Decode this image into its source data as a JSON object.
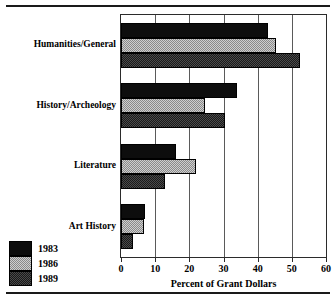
{
  "chart_data": {
    "type": "bar",
    "orientation": "horizontal",
    "title": "",
    "xlabel": "Percent of Grant Dollars",
    "ylabel": "",
    "xlim": [
      0,
      60
    ],
    "ylim": null,
    "xticks": [
      0,
      10,
      20,
      30,
      40,
      50,
      60
    ],
    "xtick_labels": [
      "0",
      "10",
      "20",
      "30",
      "40",
      "50",
      "60"
    ],
    "grid": "vertical",
    "legend_position": "bottom-left-outside",
    "categories": [
      "Humanities/General",
      "History/Archeology",
      "Literature",
      "Art History"
    ],
    "series": [
      {
        "name": "1983",
        "color": "#0d0d0d",
        "values": [
          43.0,
          34.0,
          16.0,
          7.0
        ]
      },
      {
        "name": "1986",
        "color": "#cfcfcf",
        "values": [
          45.5,
          24.5,
          22.0,
          6.8
        ]
      },
      {
        "name": "1989",
        "color": "#4a4a4a",
        "values": [
          52.5,
          30.5,
          13.0,
          3.5
        ]
      }
    ]
  },
  "legend": {
    "entries": [
      {
        "label": "1983",
        "swatch": "fill-1983"
      },
      {
        "label": "1986",
        "swatch": "fill-1986"
      },
      {
        "label": "1989",
        "swatch": "fill-1989"
      }
    ]
  },
  "axis": {
    "x_title": "Percent of Grant Dollars"
  }
}
